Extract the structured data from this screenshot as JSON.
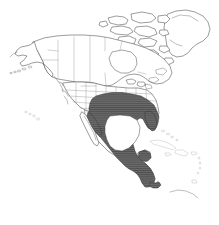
{
  "figure": {
    "kind": "species-range-map",
    "region": "North America",
    "background_color": "#ffffff",
    "width_px": 219,
    "height_px": 225,
    "has_title": false,
    "has_legend": false,
    "has_axes": false,
    "has_frame_border": false,
    "has_scale_bar": false,
    "has_graticule": false,
    "caption": ""
  },
  "style": {
    "land_fill": "#ffffff",
    "coastline_color": "#4a4a4a",
    "coastline_width_px": 0.55,
    "subdivision_border_color": "#8d8d8d",
    "subdivision_border_width_px": 0.4,
    "range_fill": "#6a6a6a",
    "range_hatch_color": "#4f4f4f",
    "range_outline_color": "#3a3a3a",
    "range_pattern": "horizontal-hatch-on-gray"
  },
  "legend": {
    "visible": false,
    "entries": [
      {
        "swatch_color": "#6a6a6a",
        "label": "Distribution range"
      }
    ]
  },
  "map_layers": [
    {
      "name": "ocean-background",
      "label": "Ocean / background",
      "color": "#ffffff"
    },
    {
      "name": "landmass-outlines",
      "label": "Continental landmasses",
      "color": "#ffffff"
    },
    {
      "name": "political-subdivisions",
      "label": "State and province boundaries",
      "color": "#8d8d8d"
    },
    {
      "name": "distribution-range",
      "label": "Shaded distribution range",
      "color": "#6a6a6a"
    }
  ],
  "features": {
    "landmasses": [
      {
        "name": "greenland",
        "label": "Greenland",
        "shaded": false
      },
      {
        "name": "canada-mainland",
        "label": "Canada",
        "shaded": false
      },
      {
        "name": "arctic-archipelago",
        "label": "Canadian Arctic Archipelago",
        "shaded": false
      },
      {
        "name": "alaska",
        "label": "Alaska",
        "shaded": false
      },
      {
        "name": "aleutian-islands",
        "label": "Aleutian Islands",
        "shaded": false
      },
      {
        "name": "united-states",
        "label": "Contiguous United States",
        "shaded": "partial"
      },
      {
        "name": "mexico",
        "label": "Mexico",
        "shaded": "partial"
      },
      {
        "name": "baja-california",
        "label": "Baja California peninsula",
        "shaded": false
      },
      {
        "name": "central-america",
        "label": "Central America",
        "shaded": true
      },
      {
        "name": "cuba",
        "label": "Cuba",
        "shaded": false
      },
      {
        "name": "hispaniola",
        "label": "Hispaniola",
        "shaded": false
      },
      {
        "name": "jamaica",
        "label": "Jamaica",
        "shaded": false
      },
      {
        "name": "puerto-rico",
        "label": "Puerto Rico",
        "shaded": false
      },
      {
        "name": "bahamas",
        "label": "Bahamas",
        "shaded": false
      },
      {
        "name": "hawaiian-islands",
        "label": "Hawaiian Islands",
        "shaded": false
      },
      {
        "name": "gulf-of-mexico",
        "label": "Gulf of Mexico",
        "shaded": false
      }
    ],
    "range_extent": {
      "label": "Shaded range",
      "description": "South-central and southeastern United States, eastern and central Mexico, and all of Central America to Panama; excludes Gulf of Mexico waters, Baja California, and the Caribbean islands",
      "northern_limit_label": "Mid-latitude central United States",
      "southern_limit_label": "Panama",
      "western_limit_label": "Pacific coast of Mexico",
      "eastern_limit_label": "Atlantic coast of the southeastern United States"
    }
  }
}
